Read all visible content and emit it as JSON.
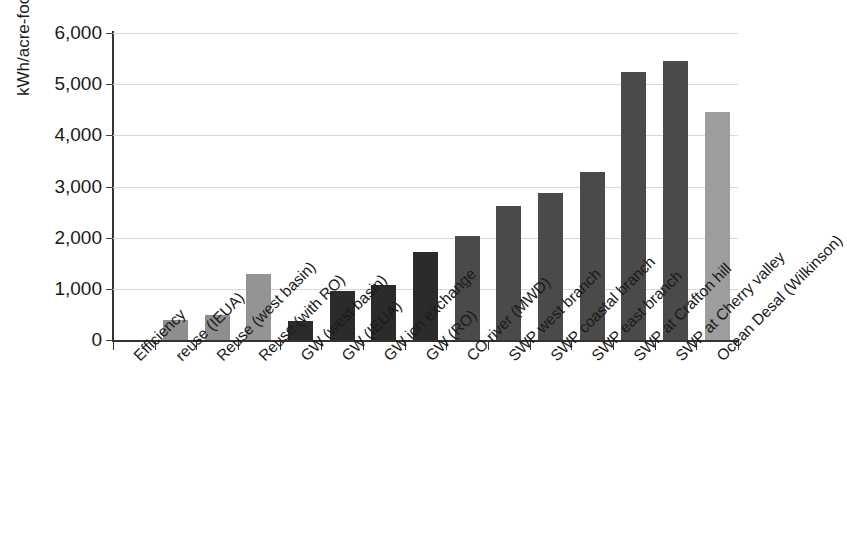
{
  "chart_data": {
    "type": "bar",
    "title": "",
    "xlabel": "",
    "ylabel": "kWh/acre-foot",
    "ylim": [
      0,
      6000
    ],
    "ytick_labels": [
      "0",
      "1,000",
      "2,000",
      "3,000",
      "4,000",
      "5,000",
      "6,000"
    ],
    "ytick_values": [
      0,
      1000,
      2000,
      3000,
      4000,
      5000,
      6000
    ],
    "grid": true,
    "legend": "none",
    "categories": [
      "Efficiency",
      "reuse (IEUA)",
      "Reuse (west basin)",
      "Reuse (with RO)",
      "GW (west basin)",
      "GW (IEUA)",
      "GW ion exchange",
      "GW (RO)",
      "CO river (MWD)",
      "SWP west branch",
      "SWP coastal branch",
      "SWP east branch",
      "SWP at Crafton hill",
      "SWP at Cherry valley",
      "Ocean Desal (Wilkinson)"
    ],
    "values": [
      0,
      400,
      490,
      1290,
      370,
      960,
      1080,
      1720,
      2030,
      2620,
      2870,
      3280,
      5230,
      5450,
      4460
    ],
    "bar_colors": [
      "#8e8e8e",
      "#8e8e8e",
      "#8e8e8e",
      "#949494",
      "#2b2b2b",
      "#2b2b2b",
      "#2b2b2b",
      "#2b2b2b",
      "#4a4a4a",
      "#4a4a4a",
      "#4a4a4a",
      "#4a4a4a",
      "#4a4a4a",
      "#4a4a4a",
      "#9d9d9d"
    ]
  },
  "colors": {
    "background": "#ffffff",
    "axis": "#333333",
    "grid": "#d8d8d8",
    "text": "#1a1a1a"
  }
}
